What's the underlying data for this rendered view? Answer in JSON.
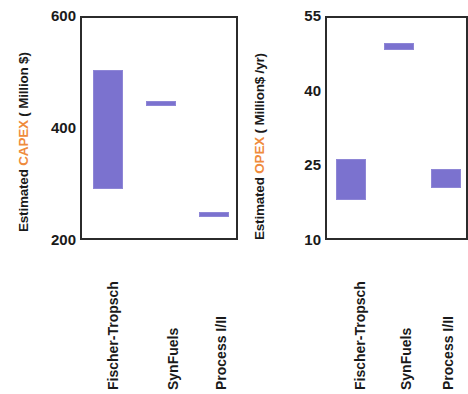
{
  "figure": {
    "accent_color": "#ef8b3c",
    "bar_color": "#7b72cf",
    "axis_color": "#2b2b2b"
  },
  "chart_data": [
    {
      "type": "bar",
      "title": "",
      "panel_name": "capex",
      "xlabel": "",
      "ylabel": "Estimated CAPEX ( Million $)",
      "ylabel_parts": {
        "prefix": "Estimated ",
        "accent": "CAPEX",
        "suffix": " ( Million $)"
      },
      "ylim": [
        200,
        600
      ],
      "yticks": [
        200,
        400,
        600
      ],
      "ytick_labels": [
        "200",
        "400",
        "600"
      ],
      "grid": false,
      "legend": "none",
      "categories": [
        "Fischer-Tropsch",
        "SynFuels",
        "Process I/II"
      ],
      "series": [
        {
          "name": "Estimated CAPEX range",
          "kind": "range",
          "low": [
            295,
            443,
            246
          ],
          "high": [
            507,
            451,
            254
          ]
        }
      ]
    },
    {
      "type": "bar",
      "title": "",
      "panel_name": "opex",
      "xlabel": "",
      "ylabel": "Estimated OPEX ( Million$ /yr)",
      "ylabel_parts": {
        "prefix": "Estimated ",
        "accent": "OPEX",
        "suffix": " ( Million$ /yr)"
      },
      "ylim": [
        10,
        55
      ],
      "yticks": [
        10,
        25,
        40,
        55
      ],
      "ytick_labels": [
        "10",
        "25",
        "40",
        "55"
      ],
      "grid": false,
      "legend": "none",
      "categories": [
        "Fischer-Tropsch",
        "SynFuels",
        "Process I/II"
      ],
      "series": [
        {
          "name": "Estimated OPEX range",
          "kind": "range",
          "low": [
            18.4,
            48.5,
            20.8
          ],
          "high": [
            26.6,
            50.0,
            24.7
          ]
        }
      ]
    }
  ]
}
